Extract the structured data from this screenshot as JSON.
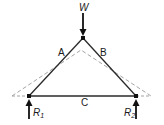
{
  "diagram": {
    "type": "truss",
    "colors": {
      "member": "#2a2a2a",
      "deformed": "#9a9a9a",
      "background": "#ffffff"
    },
    "load": {
      "label": "W"
    },
    "members": [
      {
        "id": "A",
        "label": "A"
      },
      {
        "id": "B",
        "label": "B"
      },
      {
        "id": "C",
        "label": "C"
      }
    ],
    "reactions": [
      {
        "label": "R",
        "subscript": "1"
      },
      {
        "label": "R",
        "subscript": "2"
      }
    ]
  }
}
